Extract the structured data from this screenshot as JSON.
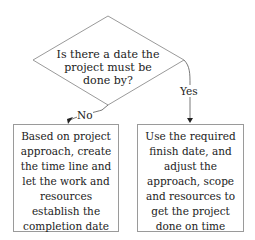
{
  "decision": {
    "lines": [
      "Is there a date the",
      "project must be",
      "done by?"
    ]
  },
  "edges": {
    "no_label": "No",
    "yes_label": "Yes"
  },
  "outcomes": {
    "no": {
      "lines": [
        "Based on project",
        "approach, create",
        "the time line and",
        "let the work and",
        "resources",
        "establish the",
        "completion date"
      ]
    },
    "yes": {
      "lines": [
        "Use the required",
        "finish date, and",
        "adjust the",
        "approach, scope",
        "and resources to",
        "get the project",
        "done on time"
      ]
    }
  },
  "colors": {
    "stroke": "#9a9a9a",
    "arrow": "#222222",
    "text": "#222222"
  }
}
